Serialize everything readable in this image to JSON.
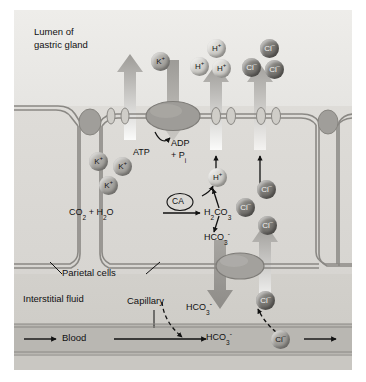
{
  "figure": {
    "regions": {
      "lumen": "Lumen of\ngastric gland",
      "lumen_line1": "Lumen of",
      "lumen_line2": "gastric gland",
      "parietal": "Parietal cells",
      "interstitial": "Interstitial fluid",
      "capillary": "Capillary",
      "blood": "Blood"
    }
  },
  "reaction": {
    "substrates": "CO2 + H2O",
    "enzyme": "CA",
    "product": "H2CO3",
    "dissociation_up": "H+",
    "dissociation_down": "HCO3-"
  },
  "pump": {
    "atp": "ATP",
    "adp": "ADP",
    "pi": "+ Pi"
  },
  "ions": {
    "k_lumen": {
      "label": "K+",
      "count": 1
    },
    "k_cytosol": {
      "label": "K+",
      "count": 3
    },
    "h_lumen": {
      "label": "H+",
      "count": 3
    },
    "h_cytosol": {
      "label": "H+",
      "count": 1
    },
    "cl_lumen": {
      "label": "Cl-",
      "count": 3
    },
    "cl_cytosol": {
      "label": "Cl-",
      "count": 3
    },
    "cl_basal": {
      "label": "Cl-",
      "count": 1
    },
    "cl_blood": {
      "label": "Cl-",
      "count": 1
    }
  },
  "transport": {
    "hco3_interstitial": "HCO3-",
    "hco3_blood": "HCO3-"
  },
  "colors": {
    "plate_bg": "#e8e8e6",
    "lumen_bg": "#eeedea",
    "cell_bg": "#dedcd8",
    "interstitial_bg": "#d2d0cb",
    "blood_bg": "#b9b7b2",
    "membrane": "#8a8884",
    "arrow_dark": "#111111",
    "ion_k": "#8d8b87",
    "ion_h": "#cfcdc8",
    "ion_cl": "#5d5b58"
  }
}
